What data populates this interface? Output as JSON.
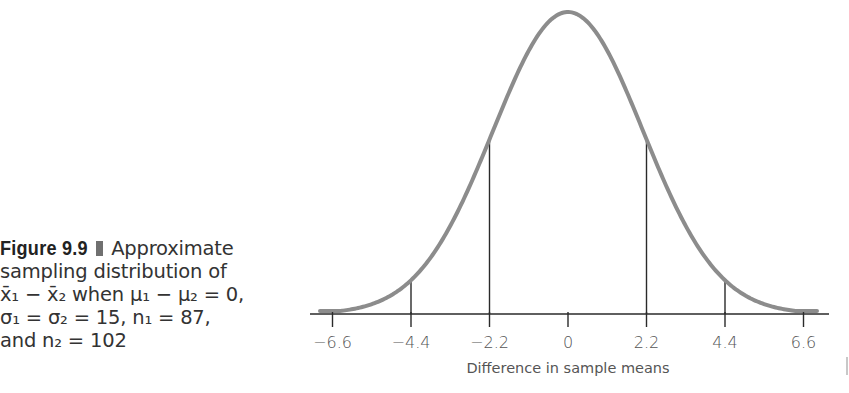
{
  "caption": {
    "figure_label": "Figure 9.9",
    "title_word": "Approximate",
    "line2": "sampling distribution of",
    "line3_expr": "x̄₁ − x̄₂",
    "line3_text": "when μ₁ − μ₂ = 0,",
    "line4": "σ₁ = σ₂ = 15, n₁ = 87,",
    "line5": "and n₂ = 102"
  },
  "chart_data": {
    "type": "line",
    "title": "Approximate sampling distribution of x̄₁ − x̄₂ when μ₁ − μ₂ = 0, σ₁ = σ₂ = 15, n₁ = 87, and n₂ = 102",
    "xlabel": "Difference in sample means",
    "ylabel": "",
    "distribution": "normal",
    "mean": 0,
    "std_dev": 2.2,
    "xlim": [
      -7,
      7
    ],
    "x_ticks": [
      -6.6,
      -4.4,
      -2.2,
      0,
      2.2,
      4.4,
      6.6
    ],
    "x_tick_labels": [
      "−6.6",
      "−4.4",
      "−2.2",
      "0",
      "2.2",
      "4.4",
      "6.6"
    ],
    "vertical_reference_lines": [
      -4.4,
      -2.2,
      2.2,
      4.4
    ],
    "grid": false,
    "legend": "none",
    "curve_color": "#8c8c8c",
    "axis_color": "#2a2a2a"
  },
  "edge_mark_color": "#c8c8c8"
}
